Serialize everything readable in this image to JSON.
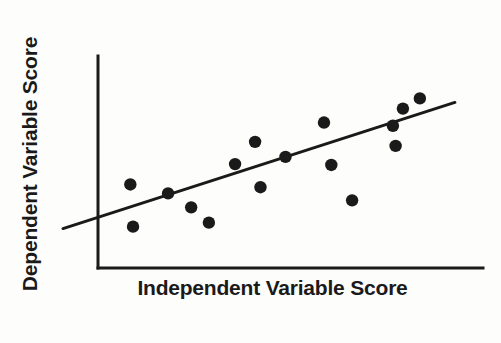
{
  "chart_data": {
    "type": "scatter",
    "title": "",
    "xlabel": "Independent Variable Score",
    "ylabel": "Dependent Variable Score",
    "grid": false,
    "legend": null,
    "axis_ticks": {
      "x": [],
      "y": []
    },
    "xlim": [
      0,
      100
    ],
    "ylim": [
      0,
      100
    ],
    "point_color": "#1a1a1a",
    "line_color": "#1a1a1a",
    "axis_color": "#1a1a1a",
    "background_color": "#fdfdfc",
    "points": [
      {
        "x": 8.4,
        "y": 39.4
      },
      {
        "x": 9.1,
        "y": 19.5
      },
      {
        "x": 18.2,
        "y": 35.2
      },
      {
        "x": 24.2,
        "y": 28.6
      },
      {
        "x": 28.8,
        "y": 21.4
      },
      {
        "x": 35.6,
        "y": 49.0
      },
      {
        "x": 42.2,
        "y": 38.1
      },
      {
        "x": 40.8,
        "y": 59.5
      },
      {
        "x": 48.7,
        "y": 52.4
      },
      {
        "x": 58.7,
        "y": 68.6
      },
      {
        "x": 60.6,
        "y": 48.6
      },
      {
        "x": 66.0,
        "y": 31.9
      },
      {
        "x": 76.6,
        "y": 67.1
      },
      {
        "x": 77.3,
        "y": 57.6
      },
      {
        "x": 79.2,
        "y": 75.2
      },
      {
        "x": 83.6,
        "y": 80.0
      }
    ],
    "fit_line": {
      "label": "line of best fit",
      "x_start": -9.1,
      "y_start": 18.6,
      "x_end": 92.7,
      "y_end": 78.1,
      "slope_note": "positive"
    },
    "point_radius_px": 6.2
  },
  "labels": {
    "x_axis": "Independent Variable Score",
    "y_axis": "Dependent Variable Score"
  }
}
